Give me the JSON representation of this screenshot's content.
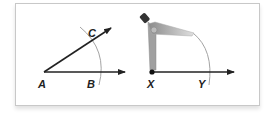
{
  "diagram": {
    "panels": [
      {
        "id": "original-angle",
        "labels": {
          "vertex": "A",
          "ray_point_1": "B",
          "ray_point_2": "C"
        },
        "description": "Angle with vertex A, rays through B and C, arc crossing both rays"
      },
      {
        "id": "copy-construction",
        "labels": {
          "vertex": "X",
          "ray_point": "Y"
        },
        "description": "Compass centered at X drawing an arc crossing ray XY at Y"
      }
    ],
    "colors": {
      "line": "#222222",
      "arc": "#999999",
      "compass": "#a8a8a8",
      "frame": "#c8c8c8"
    }
  }
}
